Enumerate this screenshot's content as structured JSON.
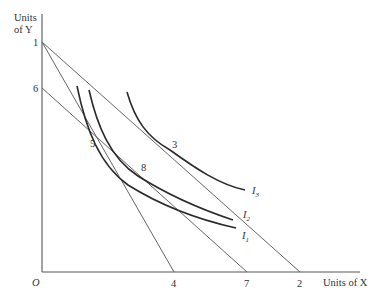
{
  "diagram": {
    "y_axis_label_line1": "Units",
    "y_axis_label_line2": "of Y",
    "x_axis_label": "Units of X",
    "origin_label": "O",
    "y_intercepts": [
      {
        "label": "1"
      },
      {
        "label": "6"
      }
    ],
    "x_intercepts": [
      {
        "label": "4"
      },
      {
        "label": "7"
      },
      {
        "label": "2"
      }
    ],
    "points": [
      {
        "label": "5"
      },
      {
        "label": "8"
      },
      {
        "label": "3"
      }
    ],
    "indifference_curves": [
      {
        "name": "I",
        "sub": "1"
      },
      {
        "name": "I",
        "sub": "2"
      },
      {
        "name": "I",
        "sub": "3"
      }
    ],
    "budget_lines": [
      {
        "from": "1",
        "to": "4"
      },
      {
        "from": "1",
        "to": "2"
      },
      {
        "from": "6",
        "to": "7"
      }
    ],
    "colors": {
      "axis": "#555555",
      "budget_line": "#666666",
      "curve": "#2a2a2a",
      "text": "#333333"
    }
  }
}
